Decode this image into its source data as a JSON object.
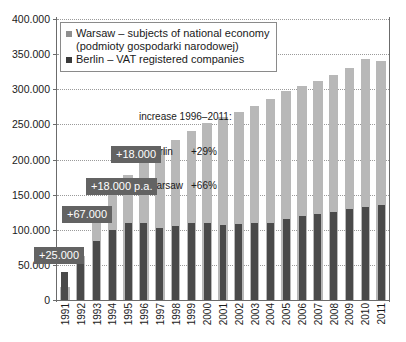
{
  "legend": {
    "warsaw_label": "Warsaw – subjects of national economy",
    "warsaw_sub": "(podmioty gospodarki narodowej)",
    "berlin_label": "Berlin – VAT registered companies"
  },
  "annotation": {
    "title": "increase 1996–2011:",
    "line_berlin_name": "– Berlin",
    "line_berlin_value": "+29%",
    "line_warsaw_name": "– Warsaw",
    "line_warsaw_value": "+66%"
  },
  "callouts": [
    {
      "label": "+18.000",
      "x": 111,
      "y": 146
    },
    {
      "label": "+18.000 p.a.",
      "x": 86,
      "y": 178
    },
    {
      "label": "+67.000",
      "x": 62,
      "y": 206
    },
    {
      "label": "+25.000",
      "x": 34,
      "y": 247
    }
  ],
  "colors": {
    "warsaw": "#b8b8b8",
    "berlin": "#4a4a4a",
    "callout_bg": "#636363",
    "axis": "#6b6b6b",
    "grid": "#9a9a9a"
  },
  "chart_data": {
    "type": "bar",
    "title": "",
    "xlabel": "",
    "ylabel": "",
    "ylim": [
      0,
      400000
    ],
    "ytick_labels": [
      "0",
      "50.000",
      "100.000",
      "150.000",
      "200.000",
      "250.000",
      "300.000",
      "350.000",
      "400.000"
    ],
    "ytick_values": [
      0,
      50000,
      100000,
      150000,
      200000,
      250000,
      300000,
      350000,
      400000
    ],
    "grid": true,
    "legend_position": "top-left",
    "categories": [
      "1991",
      "1992",
      "1993",
      "1994",
      "1995",
      "1996",
      "1997",
      "1998",
      "1999",
      "2000",
      "2001",
      "2002",
      "2003",
      "2004",
      "2005",
      "2006",
      "2007",
      "2008",
      "2009",
      "2010",
      "2011"
    ],
    "series": [
      {
        "name": "Warsaw – subjects of national economy",
        "color": "#b8b8b8",
        "values": [
          18000,
          62000,
          118000,
          152000,
          178000,
          205000,
          215000,
          228000,
          240000,
          252000,
          260000,
          268000,
          276000,
          286000,
          297000,
          305000,
          312000,
          320000,
          330000,
          343000,
          340000
        ]
      },
      {
        "name": "Berlin – VAT registered companies",
        "color": "#4a4a4a",
        "values": [
          40000,
          65000,
          84000,
          99000,
          110000,
          110000,
          103000,
          105000,
          109000,
          110000,
          107000,
          108000,
          109000,
          110000,
          116000,
          120000,
          123000,
          126000,
          130000,
          132000,
          135000
        ]
      }
    ]
  }
}
